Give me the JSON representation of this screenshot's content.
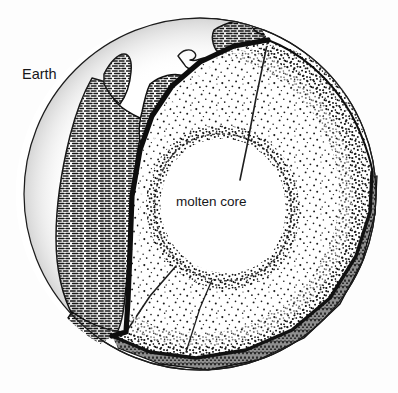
{
  "figure": {
    "kind": "cutaway-diagram",
    "style": "black-and-white pen-and-ink line art",
    "background_color": "#fdfdfd",
    "ink_color": "#17171a"
  },
  "labels": {
    "earth": "Earth",
    "molten_core": "molten core"
  },
  "regions": [
    {
      "id": "surface",
      "name": "Earth surface with continents",
      "fill": "#ffffff",
      "texture": "horizontal dash hatching on landmasses, blank oceans"
    },
    {
      "id": "mantle",
      "name": "Mantle (cut face and interior shell)",
      "fill": "#ffffff",
      "texture": "stipple / random dots, densest at the core boundary and outer rim"
    },
    {
      "id": "core",
      "name": "Molten core",
      "fill": "#ffffff",
      "texture": "blank, outlined by dense stipple"
    },
    {
      "id": "crust-band",
      "name": "Outer crust band at the cut rim",
      "fill": "#3a3a3a",
      "texture": "dense vertical hatching"
    }
  ],
  "geometry": {
    "sphere_center": [
      200,
      194
    ],
    "sphere_radius": 176,
    "core_center": [
      221,
      204
    ],
    "core_radius_x": 68,
    "core_radius_y": 70
  }
}
